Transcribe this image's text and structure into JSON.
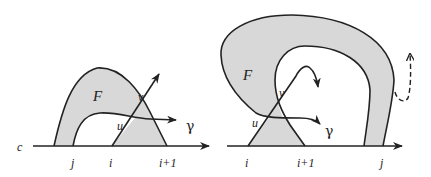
{
  "figure": {
    "colors": {
      "region_fill": "#d8d8d8",
      "stroke": "#222222",
      "background": "#ffffff"
    }
  },
  "left_diagram": {
    "axis_label": "c",
    "region_label": "F",
    "points": {
      "u": "u",
      "v": "v"
    },
    "curve_label": "γ",
    "ticks": [
      "j",
      "i",
      "i+1"
    ]
  },
  "right_diagram": {
    "region_label": "F",
    "points": {
      "u": "u",
      "v": "v"
    },
    "curve_label": "γ",
    "ticks": [
      "i",
      "i+1",
      "j"
    ],
    "dashed_arrow": "dashed-escape-arrow"
  }
}
